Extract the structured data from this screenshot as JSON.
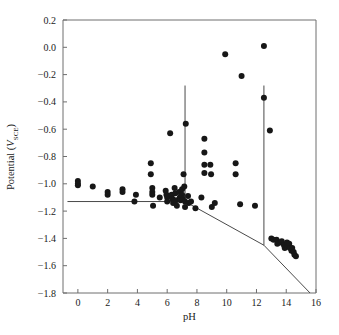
{
  "chart_data": {
    "type": "scatter",
    "title": "",
    "xlabel": "pH",
    "ylabel": "Potential (V_SCE)",
    "ylabel_main": "Potential (",
    "ylabel_var": "V",
    "ylabel_sub": "SCE",
    "ylabel_close": ")",
    "xlim": [
      -1,
      16
    ],
    "ylim": [
      -1.8,
      0.2
    ],
    "xticks": [
      0,
      2,
      4,
      6,
      8,
      10,
      12,
      14,
      16
    ],
    "xtick_labels": [
      "0",
      "2",
      "4",
      "6",
      "8",
      "10",
      "12",
      "14",
      "16"
    ],
    "yticks": [
      0.2,
      0.0,
      -0.2,
      -0.4,
      -0.6,
      -0.8,
      -1.0,
      -1.2,
      -1.4,
      -1.6,
      -1.8
    ],
    "ytick_labels": [
      "0.2",
      "0.0",
      "−0.2",
      "−0.4",
      "−0.6",
      "−0.8",
      "−1.0",
      "−1.2",
      "−1.4",
      "−1.6",
      "−1.8"
    ],
    "grid": false,
    "legend": null,
    "marker": "filled-circle",
    "marker_color": "#171717",
    "marker_size_px": 3.0,
    "line_color": "#4a4a4a",
    "frame_color": "#6e6e6e",
    "points": [
      [
        0.0,
        -0.98
      ],
      [
        0.0,
        -1.01
      ],
      [
        0.0,
        -1.0
      ],
      [
        1.0,
        -1.02
      ],
      [
        2.0,
        -1.06
      ],
      [
        2.0,
        -1.08
      ],
      [
        3.0,
        -1.04
      ],
      [
        3.0,
        -1.06
      ],
      [
        3.8,
        -1.13
      ],
      [
        3.9,
        -1.08
      ],
      [
        4.9,
        -0.85
      ],
      [
        4.9,
        -0.93
      ],
      [
        5.0,
        -1.03
      ],
      [
        5.0,
        -1.06
      ],
      [
        5.0,
        -1.08
      ],
      [
        5.05,
        -1.16
      ],
      [
        5.5,
        -1.1
      ],
      [
        5.9,
        -1.05
      ],
      [
        5.95,
        -1.08
      ],
      [
        6.0,
        -1.1
      ],
      [
        6.0,
        -1.13
      ],
      [
        6.2,
        -0.63
      ],
      [
        6.3,
        -1.08
      ],
      [
        6.35,
        -1.11
      ],
      [
        6.4,
        -1.14
      ],
      [
        6.5,
        -1.03
      ],
      [
        6.55,
        -1.07
      ],
      [
        6.6,
        -1.12
      ],
      [
        6.65,
        -1.16
      ],
      [
        6.8,
        -1.06
      ],
      [
        6.85,
        -1.1
      ],
      [
        6.9,
        -1.12
      ],
      [
        7.0,
        -1.04
      ],
      [
        7.0,
        -1.08
      ],
      [
        7.05,
        -1.11
      ],
      [
        7.1,
        -0.93
      ],
      [
        7.15,
        -1.02
      ],
      [
        7.2,
        -1.13
      ],
      [
        7.2,
        -1.17
      ],
      [
        7.25,
        -0.56
      ],
      [
        7.4,
        -1.09
      ],
      [
        7.45,
        -1.14
      ],
      [
        7.6,
        -1.13
      ],
      [
        7.9,
        -1.18
      ],
      [
        8.3,
        -1.1
      ],
      [
        8.5,
        -0.67
      ],
      [
        8.5,
        -0.77
      ],
      [
        8.5,
        -0.86
      ],
      [
        8.5,
        -0.92
      ],
      [
        8.9,
        -0.86
      ],
      [
        8.95,
        -0.93
      ],
      [
        9.0,
        -1.17
      ],
      [
        9.2,
        -1.14
      ],
      [
        9.9,
        -0.05
      ],
      [
        10.6,
        -0.85
      ],
      [
        10.6,
        -0.93
      ],
      [
        10.9,
        -1.15
      ],
      [
        11.0,
        -0.21
      ],
      [
        11.9,
        -1.16
      ],
      [
        12.5,
        0.01
      ],
      [
        12.5,
        -0.37
      ],
      [
        12.9,
        -0.61
      ],
      [
        13.0,
        -1.4
      ],
      [
        13.15,
        -1.41
      ],
      [
        13.35,
        -1.41
      ],
      [
        13.4,
        -1.44
      ],
      [
        13.6,
        -1.43
      ],
      [
        13.7,
        -1.42
      ],
      [
        13.85,
        -1.45
      ],
      [
        13.9,
        -1.47
      ],
      [
        14.05,
        -1.43
      ],
      [
        14.1,
        -1.46
      ],
      [
        14.2,
        -1.44
      ],
      [
        14.25,
        -1.47
      ],
      [
        14.35,
        -1.49
      ],
      [
        14.4,
        -1.47
      ],
      [
        14.5,
        -1.5
      ],
      [
        14.55,
        -1.52
      ],
      [
        14.65,
        -1.53
      ]
    ],
    "boundary_lines": [
      {
        "name": "immunity-passivity-boundary",
        "points": [
          [
            -0.7,
            -1.13
          ],
          [
            7.2,
            -1.13
          ],
          [
            12.5,
            -1.45
          ],
          [
            15.6,
            -1.8
          ]
        ]
      },
      {
        "name": "vertical-boundary-ph7",
        "points": [
          [
            7.2,
            -1.13
          ],
          [
            7.2,
            -0.28
          ]
        ]
      },
      {
        "name": "vertical-boundary-ph12",
        "points": [
          [
            12.5,
            -1.45
          ],
          [
            12.5,
            -0.28
          ]
        ]
      }
    ]
  },
  "axes_geometry": {
    "left_px": 63,
    "right_px": 316,
    "top_px": 20,
    "bottom_px": 293
  }
}
